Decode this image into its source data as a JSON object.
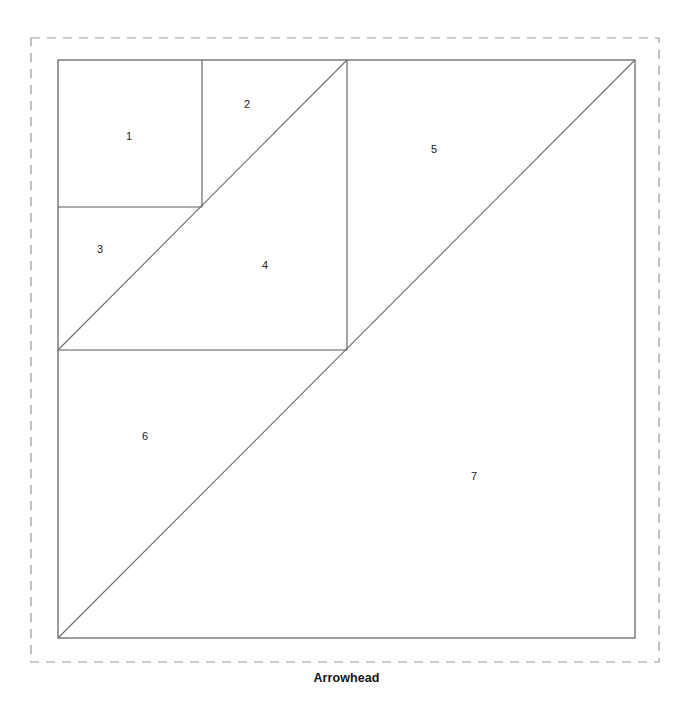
{
  "figure": {
    "caption": "Arrowhead",
    "caption_x": 346,
    "caption_y": 679,
    "background_color": "#ffffff",
    "stroke_color": "#5a5a5a",
    "diagonal_stroke_color": "#6b6b6b",
    "dashed_border_color": "#9a9a9a",
    "label_color": "#1a1a1a",
    "dashed_border": {
      "x": 31,
      "y": 38,
      "width": 628,
      "height": 624,
      "dash_pattern": "9 7",
      "stroke_width": 1.2
    },
    "outer_square": {
      "left": 58,
      "top": 60,
      "right": 635,
      "bottom": 638,
      "stroke_width": 1.2
    },
    "lines": [
      {
        "name": "main-diagonal",
        "x1": 58,
        "y1": 638,
        "x2": 635,
        "y2": 60
      },
      {
        "name": "quarter-diagonal",
        "x1": 58,
        "y1": 350,
        "x2": 347,
        "y2": 60
      },
      {
        "name": "mid-vertical",
        "x1": 347,
        "y1": 60,
        "x2": 347,
        "y2": 350
      },
      {
        "name": "mid-horizontal",
        "x1": 58,
        "y1": 350,
        "x2": 347,
        "y2": 350
      },
      {
        "name": "small-vertical",
        "x1": 202,
        "y1": 60,
        "x2": 202,
        "y2": 207
      },
      {
        "name": "small-horizontal",
        "x1": 58,
        "y1": 207,
        "x2": 202,
        "y2": 207
      }
    ],
    "pieces": [
      {
        "label": "1",
        "x": 129,
        "y": 137
      },
      {
        "label": "2",
        "x": 247,
        "y": 105
      },
      {
        "label": "3",
        "x": 100,
        "y": 250
      },
      {
        "label": "4",
        "x": 265,
        "y": 266
      },
      {
        "label": "5",
        "x": 434,
        "y": 150
      },
      {
        "label": "6",
        "x": 145,
        "y": 437
      },
      {
        "label": "7",
        "x": 474,
        "y": 477
      }
    ]
  }
}
